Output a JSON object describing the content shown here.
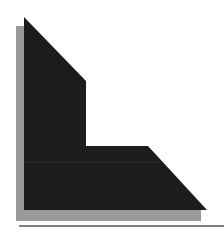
{
  "graphic": {
    "label": "L-shaped corner graphic with drop shadow",
    "colors": {
      "background": "#ffffff",
      "shape_fill": "#1c1c1c",
      "shadow_fill": "#9a9a9a",
      "rule_stroke": "#555555",
      "seam_line": "#3a3a3a"
    },
    "shadow_polygon": "16,26 24,26 24,210 201,210 201,221 16,221",
    "shape_polygon": "24,17 86,81 86,146 148,146 207,210 24,210",
    "seam_line": {
      "x1": 24,
      "y1": 162,
      "x2": 163,
      "y2": 162
    },
    "baseline_rule": {
      "x1": 19,
      "y1": 226,
      "x2": 224,
      "y2": 226
    }
  }
}
